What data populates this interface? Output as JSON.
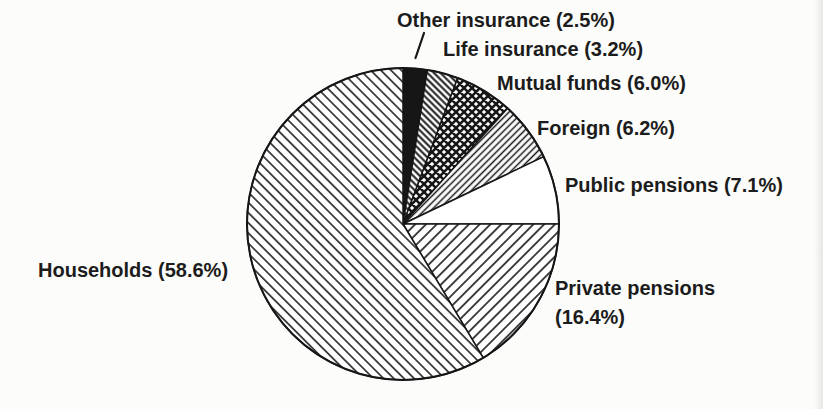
{
  "figure": {
    "ink": "#161616",
    "paper": "#ffffff",
    "text_color": "#1c1c1c"
  },
  "chart_data": {
    "type": "pie",
    "unit": "%",
    "direction": "clockwise",
    "start_angle": "12-oclock",
    "categories": [
      "Other insurance",
      "Life insurance",
      "Mutual funds",
      "Foreign",
      "Public pensions",
      "Private pensions",
      "Households"
    ],
    "values": [
      2.5,
      3.2,
      6.0,
      6.2,
      7.1,
      16.4,
      58.6
    ],
    "legend_position": "labels-around-pie",
    "grid": false,
    "slices": [
      {
        "key": "other-insurance",
        "label": "Other insurance (2.5%)",
        "value": 2.5,
        "pattern": "solid-black"
      },
      {
        "key": "life-insurance",
        "label": "Life insurance (3.2%)",
        "value": 3.2,
        "pattern": "hatch-back-dense"
      },
      {
        "key": "mutual-funds",
        "label": "Mutual funds (6.0%)",
        "value": 6.0,
        "pattern": "crosshatch"
      },
      {
        "key": "foreign",
        "label": "Foreign (6.2%)",
        "value": 6.2,
        "pattern": "hatch-fwd-dense"
      },
      {
        "key": "public-pensions",
        "label": "Public pensions (7.1%)",
        "value": 7.1,
        "pattern": "plain-white"
      },
      {
        "key": "private-pensions",
        "label": "Private pensions (16.4%)",
        "value": 16.4,
        "pattern": "hatch-fwd-wide"
      },
      {
        "key": "households",
        "label": "Households (58.6%)",
        "value": 58.6,
        "pattern": "hatch-back-wide"
      }
    ]
  }
}
